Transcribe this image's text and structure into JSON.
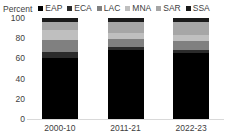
{
  "chart_data": {
    "type": "bar",
    "subtype": "stacked-column-100pct",
    "title": "",
    "xlabel": "",
    "ylabel": "Percent",
    "ylim": [
      0,
      100
    ],
    "yticks": [
      0,
      20,
      40,
      60,
      80,
      100
    ],
    "ytick_labels": [
      "0",
      "20",
      "40",
      "60",
      "80",
      "100"
    ],
    "grid": false,
    "legend_position": "top",
    "categories": [
      "2000-10",
      "2011-21",
      "2022-23"
    ],
    "series": [
      {
        "name": "EAP",
        "color": "#000000",
        "values": [
          60,
          68,
          65
        ]
      },
      {
        "name": "ECA",
        "color": "#2b2b2b",
        "values": [
          6,
          3,
          3
        ]
      },
      {
        "name": "LAC",
        "color": "#808080",
        "values": [
          12,
          8,
          9
        ]
      },
      {
        "name": "MNA",
        "color": "#bfbfbf",
        "values": [
          10,
          6,
          6
        ]
      },
      {
        "name": "SAR",
        "color": "#a6a6a6",
        "values": [
          8,
          11,
          13
        ]
      },
      {
        "name": "SSA",
        "color": "#1a1a1a",
        "values": [
          4,
          4,
          4
        ]
      }
    ]
  },
  "legend": {
    "axis_title": "Percent",
    "items": [
      {
        "label": "EAP",
        "color": "#000000"
      },
      {
        "label": "ECA",
        "color": "#2b2b2b"
      },
      {
        "label": "LAC",
        "color": "#808080"
      },
      {
        "label": "MNA",
        "color": "#bfbfbf"
      },
      {
        "label": "SAR",
        "color": "#a6a6a6"
      },
      {
        "label": "SSA",
        "color": "#1a1a1a"
      }
    ]
  },
  "colors": {
    "axis_line": "#d9d9d9",
    "text": "#404040",
    "background": "#ffffff"
  }
}
